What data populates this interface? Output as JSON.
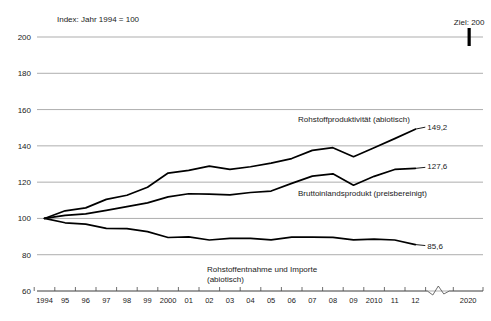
{
  "chart_data": {
    "type": "line",
    "title": "",
    "subtitle": "",
    "index_note": "Index: Jahr 1994 = 100",
    "xlabel": "",
    "ylabel": "",
    "ylim": [
      60,
      200
    ],
    "ytick_step": 20,
    "grid": true,
    "legend_position": "inline-annotations",
    "yticks": [
      200,
      180,
      160,
      140,
      120,
      100,
      80,
      60
    ],
    "ytick_labels": [
      "200",
      "180",
      "160",
      "140",
      "120",
      "100",
      "80",
      "60"
    ],
    "x": [
      1994,
      1995,
      1996,
      1997,
      1998,
      1999,
      2000,
      2001,
      2002,
      2003,
      2004,
      2005,
      2006,
      2007,
      2008,
      2009,
      2010,
      2011,
      2012
    ],
    "xtick_labels": [
      "1994",
      "95",
      "96",
      "97",
      "98",
      "99",
      "2000",
      "01",
      "02",
      "03",
      "04",
      "05",
      "06",
      "07",
      "08",
      "09",
      "2010",
      "11",
      "12"
    ],
    "axis_break": true,
    "axis_break_label": "2020",
    "target": {
      "label": "Ziel: 200",
      "value": 200,
      "year": 2020
    },
    "series": [
      {
        "name": "Rohstoffproduktivität (abiotisch)",
        "label": "Rohstoffproduktivität (abiotisch)",
        "end_value_label": "149,2",
        "end_value": 149.2,
        "values": [
          100.0,
          104.2,
          105.8,
          110.5,
          112.8,
          117.2,
          125.0,
          126.5,
          128.8,
          127.0,
          128.5,
          130.5,
          133.0,
          137.5,
          139.0,
          134.0,
          139.0,
          144.0,
          149.2
        ]
      },
      {
        "name": "Bruttoinlandsprodukt (preisbereinigt)",
        "label": "Bruttoinlandsprodukt (preisbereinigt)",
        "end_value_label": "127,6",
        "end_value": 127.6,
        "values": [
          100.0,
          101.7,
          102.5,
          104.4,
          106.5,
          108.6,
          111.9,
          113.6,
          113.4,
          113.0,
          114.3,
          115.1,
          119.3,
          123.3,
          124.6,
          118.3,
          123.2,
          127.0,
          127.6
        ]
      },
      {
        "name": "Rohstoffentnahme und Importe (abiotisch)",
        "label": "Rohstoffentnahme und Importe",
        "label_line2": "(abiotisch)",
        "end_value_label": "85,6",
        "end_value": 85.6,
        "values": [
          100.0,
          97.6,
          96.9,
          94.5,
          94.4,
          92.7,
          89.5,
          89.8,
          88.1,
          89.0,
          89.0,
          88.2,
          89.7,
          89.7,
          89.6,
          88.2,
          88.6,
          88.1,
          85.6
        ]
      }
    ]
  }
}
